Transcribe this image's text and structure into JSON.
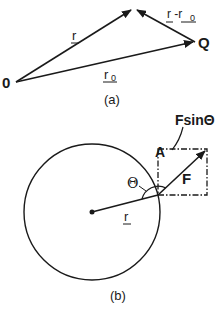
{
  "diagram_a": {
    "caption": "(a)",
    "origin_label": "0",
    "point_label": "Q",
    "vector_r_label": "r",
    "vector_r0_label": "r",
    "vector_r0_subscript": "0",
    "vector_diff_label": "r -r",
    "vector_diff_subscript": "0"
  },
  "diagram_b": {
    "caption": "(b)",
    "force_label": "F",
    "component_label": "FsinΘ",
    "point_label": "A",
    "angle_label": "Θ",
    "radius_label": "r"
  },
  "colors": {
    "ink": "#1a1a1a",
    "background": "#ffffff"
  }
}
